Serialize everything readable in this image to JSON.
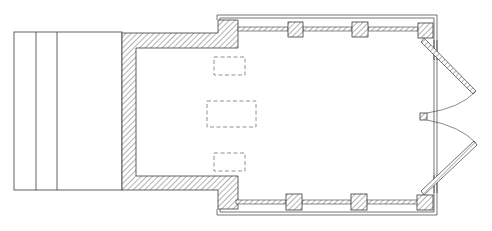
{
  "drawing": {
    "title": "Floor plan",
    "colors": {
      "background": "#ffffff",
      "line": "#3a3a3a",
      "hatch": "#555555",
      "dashed": "#777777"
    },
    "elements": [
      "steps",
      "rear-masonry-wall",
      "main-hall-walls",
      "pillars",
      "dashed-furniture",
      "double-doors",
      "center-post"
    ]
  }
}
